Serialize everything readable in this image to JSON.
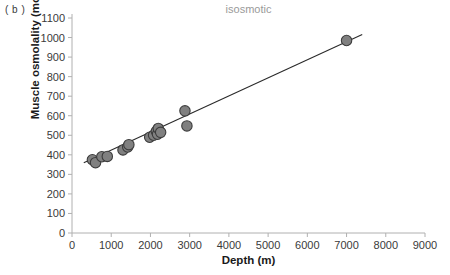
{
  "panel": {
    "label": "( b )"
  },
  "chart_data": {
    "type": "scatter",
    "title": "isosmotic",
    "xlabel": "Depth (m)",
    "ylabel": "Muscle osmolality (mosmol kg-1)",
    "ylabel_display": "Muscle osmolality (mosmol kg⁻¹)",
    "xlim": [
      0,
      9000
    ],
    "ylim": [
      0,
      1100
    ],
    "xticks": [
      0,
      1000,
      2000,
      3000,
      4000,
      5000,
      6000,
      7000,
      8000,
      9000
    ],
    "yticks": [
      0,
      100,
      200,
      300,
      400,
      500,
      600,
      700,
      800,
      900,
      1000,
      1100
    ],
    "grid": false,
    "legend": "none",
    "marker_color": "#808080",
    "marker_edge_color": "#3c3c3c",
    "line_color": "#2a2a2a",
    "title_color": "#9a9a9a",
    "axis_color": "#b0b0b0",
    "points": [
      {
        "x": 520,
        "y": 375
      },
      {
        "x": 600,
        "y": 360
      },
      {
        "x": 760,
        "y": 390
      },
      {
        "x": 900,
        "y": 392
      },
      {
        "x": 1300,
        "y": 425
      },
      {
        "x": 1420,
        "y": 440
      },
      {
        "x": 1450,
        "y": 452
      },
      {
        "x": 1980,
        "y": 490
      },
      {
        "x": 2080,
        "y": 500
      },
      {
        "x": 2150,
        "y": 520
      },
      {
        "x": 2180,
        "y": 505
      },
      {
        "x": 2200,
        "y": 535
      },
      {
        "x": 2260,
        "y": 515
      },
      {
        "x": 2880,
        "y": 625
      },
      {
        "x": 2930,
        "y": 548
      },
      {
        "x": 7000,
        "y": 985
      }
    ],
    "fit_line": {
      "x0": 300,
      "y0": 360,
      "x1": 7400,
      "y1": 1015
    }
  }
}
